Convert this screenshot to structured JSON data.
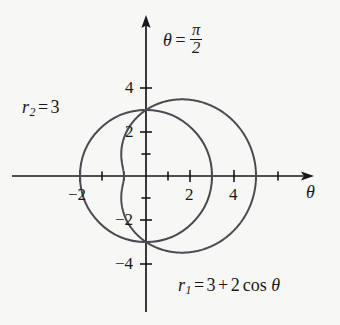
{
  "figure": {
    "background_color": "#f7f7f5",
    "axis_color": "#17171a",
    "curve_color": "#4b4b52",
    "origin_px": [
      146,
      176
    ],
    "scale_px_per_unit": 22.0
  },
  "axes": {
    "x_axis_label": "θ",
    "y_axis_label_parts": {
      "theta": "θ",
      "equals": "=",
      "numerator": "π",
      "denominator": "2"
    },
    "y_axis_label_text": "θ = π/2",
    "x_ticks": [
      -3,
      -2,
      -1,
      1,
      2,
      3,
      4,
      5
    ],
    "x_tick_labels": [
      {
        "value": -2,
        "text": "−2"
      },
      {
        "value": 2,
        "text": "2"
      },
      {
        "value": 4,
        "text": "4"
      }
    ],
    "y_ticks": [
      -4,
      -3,
      -2,
      -1,
      1,
      2,
      3,
      4
    ],
    "y_tick_labels": [
      {
        "value": 4,
        "text": "4"
      },
      {
        "value": 2,
        "text": "2"
      },
      {
        "value": -2,
        "text": "−2"
      },
      {
        "value": -4,
        "text": "−4"
      }
    ],
    "xlim": [
      -4.3,
      7.0
    ],
    "ylim": [
      -5.6,
      5.7
    ],
    "grid": false,
    "arrowheads": [
      "x-positive",
      "y-positive"
    ]
  },
  "curves": [
    {
      "id": "r1",
      "label_parts": {
        "name": "r",
        "subscript": "1",
        "equals": "=",
        "constant": "3",
        "plus": "+",
        "coefficient": "2",
        "func": "cos",
        "variable": "θ"
      },
      "label_text": "r₁ = 3 + 2 cos θ",
      "equation": "r = 3 + 2*cos(theta)",
      "type": "limacon",
      "color": "#4b4b52"
    },
    {
      "id": "r2",
      "label_parts": {
        "name": "r",
        "subscript": "2",
        "equals": "=",
        "constant": "3"
      },
      "label_text": "r₂ = 3",
      "equation": "r = 3",
      "type": "circle",
      "radius": 3,
      "color": "#4b4b52"
    }
  ],
  "chart_data": {
    "type": "line",
    "title": "",
    "subtitle": "",
    "xlabel": "θ",
    "ylabel": "θ = π/2",
    "coordinate_system": "polar-plotted-on-cartesian",
    "xlim": [
      -4.3,
      7.0
    ],
    "ylim": [
      -5.6,
      5.7
    ],
    "xticks": [
      -2,
      2,
      4
    ],
    "yticks": [
      -4,
      -2,
      2,
      4
    ],
    "grid": false,
    "legend": "inline-annotations",
    "annotations": [
      {
        "text": "θ = π/2",
        "target": "y-axis",
        "x": 0.55,
        "y": 5.1
      },
      {
        "text": "r₂ = 3",
        "target": "circle",
        "x": -4.0,
        "y": 3.0
      },
      {
        "text": "r₁ = 3 + 2 cos θ",
        "target": "limacon",
        "x": 1.2,
        "y": -4.6
      }
    ],
    "intersections": [
      [
        0,
        3
      ],
      [
        0,
        -3
      ]
    ],
    "series": [
      {
        "name": "r₁ = 3 + 2 cos θ",
        "polar_r_of_theta": "3 + 2*cos(theta)",
        "theta_deg": [
          0,
          15,
          30,
          45,
          60,
          75,
          90,
          105,
          120,
          135,
          150,
          165,
          180,
          195,
          210,
          225,
          240,
          255,
          270,
          285,
          300,
          315,
          330,
          345,
          360
        ],
        "r": [
          5.0,
          4.93,
          4.73,
          4.41,
          4.0,
          3.52,
          3.0,
          2.48,
          2.0,
          1.59,
          1.27,
          1.07,
          1.0,
          1.07,
          1.27,
          1.59,
          2.0,
          2.48,
          3.0,
          3.52,
          4.0,
          4.41,
          4.73,
          4.93,
          5.0
        ],
        "x_max": 5.0,
        "x_min": -1.0,
        "y_max": 3.41,
        "y_min": -3.41
      },
      {
        "name": "r₂ = 3",
        "polar_r_of_theta": "3",
        "theta_deg": [
          0,
          45,
          90,
          135,
          180,
          225,
          270,
          315,
          360
        ],
        "r": [
          3,
          3,
          3,
          3,
          3,
          3,
          3,
          3,
          3
        ],
        "x_max": 3.0,
        "x_min": -3.0,
        "y_max": 3.0,
        "y_min": -3.0
      }
    ]
  }
}
